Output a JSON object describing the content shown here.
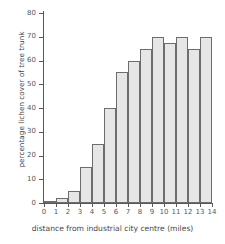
{
  "chart_data": {
    "type": "bar",
    "title": "",
    "xlabel": "distance from industrial city centre (miles)",
    "ylabel": "percentage lichen cover of tree trunk",
    "categories": [
      "0",
      "1",
      "2",
      "3",
      "4",
      "5",
      "6",
      "7",
      "8",
      "9",
      "10",
      "11",
      "12",
      "13",
      "14"
    ],
    "values": [
      0,
      1,
      2,
      5,
      15,
      25,
      40,
      55,
      60,
      65,
      70,
      67.5,
      70,
      65,
      70
    ],
    "xticklabels": [
      "0",
      "1",
      "2",
      "3",
      "4",
      "5",
      "6",
      "7",
      "8",
      "9",
      "10",
      "11",
      "12",
      "13",
      "14"
    ],
    "yticklabels": [
      "0",
      "10",
      "20",
      "30",
      "40",
      "50",
      "60",
      "70",
      "80"
    ],
    "ytickvalues": [
      0,
      10,
      20,
      30,
      40,
      50,
      60,
      70,
      80
    ],
    "ylim": [
      0,
      80
    ],
    "xlim": [
      0,
      14
    ],
    "grid": false,
    "legend": false,
    "bar_fill_color": "#e6e6e6",
    "bar_edge_color": "#6d6d6d",
    "axis_color": "#58585a",
    "text_color": "#575757",
    "background_color": "#ffffff"
  }
}
